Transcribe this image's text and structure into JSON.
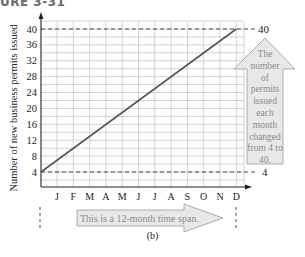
{
  "figure": {
    "title": "URE 3-31",
    "caption": "(b)"
  },
  "chart_data": {
    "type": "line",
    "title": "",
    "xlabel": "",
    "ylabel": "Number of new business permits issued",
    "categories": [
      "J",
      "F",
      "M",
      "A",
      "M",
      "J",
      "J",
      "A",
      "S",
      "O",
      "N",
      "D"
    ],
    "series": [
      {
        "name": "Permits issued",
        "values": [
          4,
          7.27,
          10.55,
          13.82,
          17.09,
          20.36,
          23.64,
          26.91,
          30.18,
          33.45,
          36.73,
          40
        ]
      }
    ],
    "yticks": [
      4,
      8,
      12,
      16,
      20,
      24,
      28,
      32,
      36,
      40
    ],
    "ylim": [
      0,
      42
    ],
    "grid": true,
    "reference_lines": [
      {
        "y": 40,
        "style": "dashed",
        "label": "40"
      },
      {
        "y": 4,
        "style": "dashed",
        "label": "4"
      }
    ],
    "annotations": [
      {
        "type": "vertical-arrow",
        "text": "The number of permits issued each month changed from 4 to 40."
      },
      {
        "type": "horizontal-arrow",
        "text": "This is a 12-month time span."
      }
    ],
    "colors": {
      "line": "#555555",
      "grid": "#c8c8c8",
      "arrow_fill": "#e8e8e8",
      "arrow_stroke": "#9a9a9a",
      "annotation_text": "#8a8a8a"
    }
  },
  "annotations": {
    "vertical_arrow_lines": [
      "The",
      "number",
      "of",
      "permits",
      "issued",
      "each",
      "month",
      "changed",
      "from 4 to",
      "40."
    ],
    "horizontal_arrow_text": "This is a 12-month time span.",
    "right_label_top": "40",
    "right_label_bottom": "4"
  }
}
